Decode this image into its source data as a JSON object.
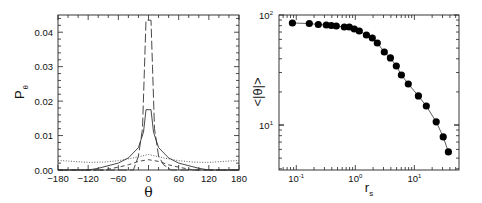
{
  "chart_data": [
    {
      "panel": "left",
      "type": "line",
      "title": "",
      "xlabel": "θ",
      "ylabel": "Pθ",
      "ylabel_main": "P",
      "ylabel_sub": "θ",
      "xlim": [
        -180,
        180
      ],
      "ylim": [
        0,
        0.045
      ],
      "xticks": [
        -180,
        -120,
        -60,
        0,
        60,
        120,
        180
      ],
      "xtick_labels": [
        "−180",
        "−120",
        "−60",
        "0",
        "60",
        "120",
        "180"
      ],
      "yticks": [
        0.0,
        0.01,
        0.02,
        0.03,
        0.04
      ],
      "ytick_labels": [
        "0.00",
        "0.01",
        "0.02",
        "0.03",
        "0.04"
      ],
      "grid": false,
      "legend": null,
      "series": [
        {
          "name": "solid",
          "style": "solid",
          "x": [
            -180,
            -120,
            -100,
            -60,
            -40,
            -20,
            -10,
            -5,
            5,
            10,
            20,
            40,
            60,
            100,
            120,
            180
          ],
          "y": [
            0.0,
            0.0,
            0.0005,
            0.002,
            0.0035,
            0.0065,
            0.011,
            0.0175,
            0.0175,
            0.011,
            0.0065,
            0.0035,
            0.002,
            0.0005,
            0.0,
            0.0
          ]
        },
        {
          "name": "long-dashed",
          "style": "dash-long",
          "x": [
            -180,
            -30,
            -20,
            -12,
            -8,
            -5,
            5,
            8,
            12,
            20,
            30,
            45,
            180
          ],
          "y": [
            0.0,
            0.0,
            0.004,
            0.012,
            0.03,
            0.0435,
            0.0435,
            0.03,
            0.012,
            0.004,
            0.0015,
            0.0,
            0.0
          ]
        },
        {
          "name": "medium-dashed",
          "style": "dash-medium",
          "x": [
            -180,
            -90,
            -60,
            -40,
            -20,
            0,
            20,
            40,
            60,
            90,
            180
          ],
          "y": [
            0.0,
            0.0,
            0.0008,
            0.0015,
            0.0025,
            0.003,
            0.0025,
            0.0015,
            0.0008,
            0.0,
            0.0
          ]
        },
        {
          "name": "dotted",
          "style": "dotted",
          "x": [
            -180,
            -150,
            -120,
            -90,
            -60,
            -30,
            0,
            30,
            60,
            90,
            120,
            150,
            180
          ],
          "y": [
            0.0028,
            0.0025,
            0.0022,
            0.0023,
            0.0027,
            0.0035,
            0.0045,
            0.0035,
            0.0027,
            0.0023,
            0.0022,
            0.0025,
            0.0028
          ]
        }
      ]
    },
    {
      "panel": "right",
      "type": "line",
      "title": "",
      "xlabel": "rs",
      "xlabel_main": "r",
      "xlabel_sub": "s",
      "ylabel": "<|θ|>",
      "xscale": "log",
      "yscale": "log",
      "xlim": [
        0.051,
        57
      ],
      "ylim": [
        3.9,
        100
      ],
      "xticks": [
        0.1,
        1,
        10
      ],
      "xtick_labels": [
        [
          "10",
          "-1"
        ],
        [
          "10",
          "0"
        ],
        [
          "10",
          "1"
        ]
      ],
      "yticks": [
        10,
        100
      ],
      "ytick_labels": [
        [
          "10",
          "1"
        ],
        [
          "10",
          "2"
        ]
      ],
      "grid": false,
      "legend": null,
      "marker": "filled-circle",
      "series": [
        {
          "name": "mean |θ|",
          "x": [
            0.086,
            0.166,
            0.236,
            0.323,
            0.392,
            0.476,
            0.652,
            0.791,
            0.962,
            1.17,
            1.54,
            1.94,
            2.36,
            3.1,
            3.92,
            4.94,
            6.02,
            7.89,
            11.7,
            15.9,
            23.4,
            30.8,
            37.7
          ],
          "y": [
            84.6,
            83.7,
            82.0,
            81.1,
            80.3,
            79.4,
            77.8,
            77.8,
            74.6,
            71.5,
            65.8,
            61.8,
            55.6,
            46.1,
            40.7,
            34.4,
            28.5,
            23.6,
            18.4,
            14.9,
            10.7,
            7.8,
            5.7
          ]
        }
      ]
    }
  ]
}
